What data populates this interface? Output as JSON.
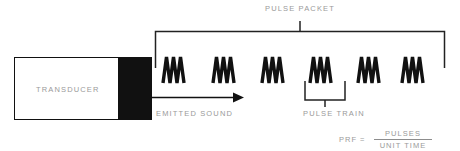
{
  "diagram": {
    "colors": {
      "ink": "#111111",
      "label": "#9a9a9a",
      "background": "#ffffff"
    },
    "transducer": {
      "label": "TRANSDUCER",
      "face_color": "#111111",
      "body_color": "#ffffff"
    },
    "emitted_sound": {
      "label": "EMITTED SOUND",
      "arrow_direction": "right"
    },
    "pulse_packet": {
      "label": "PULSE PACKET",
      "pulse_count": 6,
      "bracket_orientation": "up"
    },
    "pulse_train": {
      "label": "PULSE TRAIN",
      "highlighted_pulse_index": 4,
      "bracket_orientation": "down"
    },
    "prf": {
      "label": "PRF",
      "equals": "=",
      "numerator": "PULSES",
      "denominator": "UNIT TIME"
    },
    "pulses": [
      {
        "name": "pulse-1",
        "x": 163
      },
      {
        "name": "pulse-2",
        "x": 213
      },
      {
        "name": "pulse-3",
        "x": 262
      },
      {
        "name": "pulse-4",
        "x": 310
      },
      {
        "name": "pulse-5",
        "x": 358
      },
      {
        "name": "pulse-6",
        "x": 402
      }
    ]
  }
}
